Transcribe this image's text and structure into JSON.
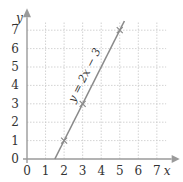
{
  "chart_data": {
    "type": "line",
    "title": "",
    "xlabel": "x",
    "ylabel": "y",
    "xlim": [
      0,
      7
    ],
    "ylim": [
      0,
      7
    ],
    "x_ticks": [
      "0",
      "1",
      "2",
      "3",
      "4",
      "5",
      "6",
      "7"
    ],
    "y_ticks": [
      "0",
      "1",
      "2",
      "3",
      "4",
      "5",
      "6",
      "7"
    ],
    "grid": true,
    "series": [
      {
        "name": "y = 2x − 3",
        "equation": "y = 2x − 3",
        "x": [
          1.5,
          5.25
        ],
        "y": [
          0,
          7.5
        ]
      }
    ],
    "marked_points": [
      {
        "x": 2,
        "y": 1
      },
      {
        "x": 3,
        "y": 3
      },
      {
        "x": 5,
        "y": 7
      }
    ],
    "annotation": "y = 2x − 3"
  },
  "colors": {
    "axis": "#9a9a9a",
    "grid": "#c8c8c8",
    "line": "#8a8a8a",
    "text": "#333333"
  }
}
